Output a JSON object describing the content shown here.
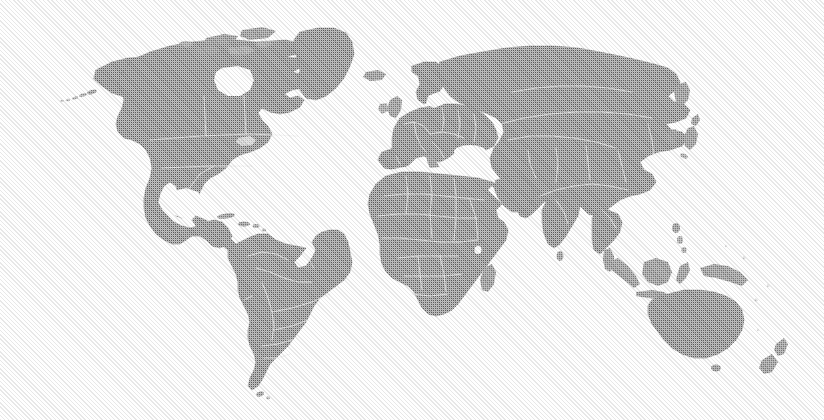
{
  "figure": {
    "kind": "world-map",
    "projection": "equirectangular",
    "width": 824,
    "height": 420,
    "background_color": "#fefefe",
    "land_color": "#6a6a6a",
    "land_edge_color": "#5a5a5a",
    "border_color": "#e8e8e8",
    "texture": "halftone-dither",
    "has_frame": false,
    "has_labels": false,
    "has_legend": false,
    "has_graticule": false,
    "antarctica_shown": false,
    "ocean_color": "#fefefe"
  },
  "map_data": {
    "type": "choropleth-silhouette",
    "regions": [
      {
        "name": "North America",
        "shown": true
      },
      {
        "name": "Greenland",
        "shown": true
      },
      {
        "name": "South America",
        "shown": true
      },
      {
        "name": "Europe",
        "shown": true
      },
      {
        "name": "Africa",
        "shown": true
      },
      {
        "name": "Asia",
        "shown": true
      },
      {
        "name": "Oceania",
        "shown": true
      },
      {
        "name": "Antarctica",
        "shown": false
      }
    ],
    "notable_features": [
      "Aleutian Islands",
      "Alaska",
      "Hudson Bay",
      "Gulf of Mexico",
      "Caribbean islands",
      "Iceland",
      "British Isles",
      "Scandinavia",
      "Mediterranean Sea",
      "Black Sea",
      "Caspian Sea",
      "Arabian Peninsula",
      "Indian subcontinent",
      "Sri Lanka",
      "Indochina",
      "Japan",
      "Korean Peninsula",
      "Borneo",
      "Sumatra",
      "Java",
      "New Guinea",
      "Australia",
      "New Zealand",
      "Madagascar",
      "Tierra del Fuego"
    ],
    "country_borders_visible": true
  }
}
